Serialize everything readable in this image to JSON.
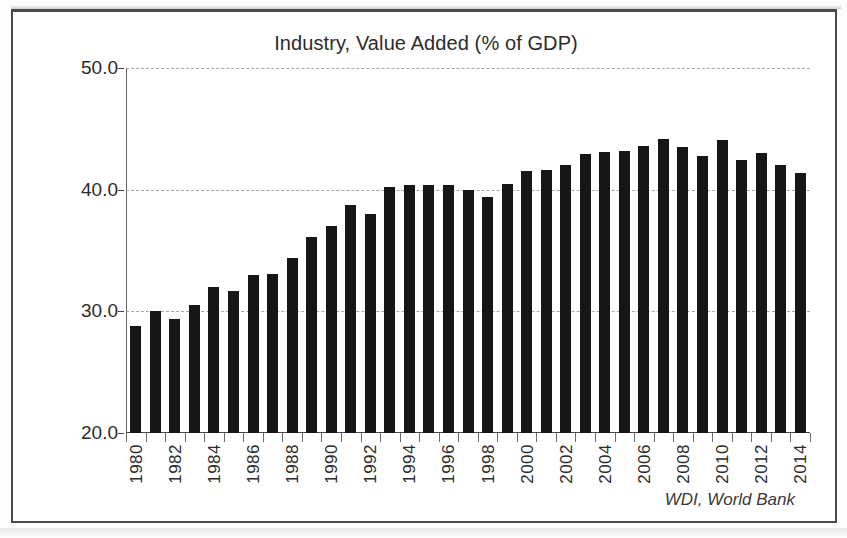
{
  "chart_data": {
    "type": "bar",
    "title": "Industry, Value Added (% of GDP)",
    "xlabel": "",
    "ylabel": "",
    "ylim": [
      20.0,
      50.0
    ],
    "y_ticks": [
      "20.0",
      "30.0",
      "40.0",
      "50.0"
    ],
    "y_tick_values": [
      20.0,
      30.0,
      40.0,
      50.0
    ],
    "grid": "horizontal-dashed",
    "legend": "none",
    "source_note": "WDI, World Bank",
    "bar_color": "#161616",
    "x_tick_labels": [
      "1980",
      "1982",
      "1984",
      "1986",
      "1988",
      "1990",
      "1992",
      "1994",
      "1996",
      "1998",
      "2000",
      "2002",
      "2004",
      "2006",
      "2008",
      "2010",
      "2012",
      "2014"
    ],
    "categories": [
      "1980",
      "1981",
      "1982",
      "1983",
      "1984",
      "1985",
      "1986",
      "1987",
      "1988",
      "1989",
      "1990",
      "1991",
      "1992",
      "1993",
      "1994",
      "1995",
      "1996",
      "1997",
      "1998",
      "1999",
      "2000",
      "2001",
      "2002",
      "2003",
      "2004",
      "2005",
      "2006",
      "2007",
      "2008",
      "2009",
      "2010",
      "2011",
      "2012",
      "2013",
      "2014"
    ],
    "values": [
      28.8,
      30.0,
      29.4,
      30.5,
      32.0,
      31.7,
      33.0,
      33.1,
      34.4,
      36.1,
      37.0,
      38.7,
      38.0,
      40.2,
      40.4,
      40.4,
      40.4,
      40.0,
      39.4,
      40.5,
      41.5,
      41.6,
      42.0,
      42.9,
      43.1,
      43.2,
      43.6,
      44.2,
      43.5,
      42.8,
      44.1,
      42.4,
      43.0,
      42.0,
      41.4
    ]
  }
}
